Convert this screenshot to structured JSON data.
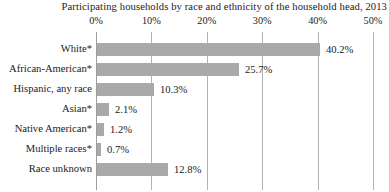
{
  "chart_data": {
    "type": "bar",
    "orientation": "horizontal",
    "title": "Participating households by race and ethnicity of the household head, 2013",
    "categories": [
      "White*",
      "African-American*",
      "Hispanic, any race",
      "Asian*",
      "Native American*",
      "Multiple races*",
      "Race unknown"
    ],
    "values": [
      40.2,
      25.7,
      10.3,
      2.1,
      1.2,
      0.7,
      12.8
    ],
    "value_labels": [
      "40.2%",
      "25.7%",
      "10.3%",
      "2.1%",
      "1.2%",
      "0.7%",
      "12.8%"
    ],
    "xlabel": "",
    "ylabel": "",
    "xlim": [
      0,
      50
    ],
    "x_tick_values": [
      0,
      10,
      20,
      30,
      40,
      50
    ],
    "x_tick_labels": [
      "0%",
      "10%",
      "20%",
      "30%",
      "40%",
      "50%"
    ],
    "grid": "vertical",
    "legend": "none",
    "bar_color": "#a9a9a9",
    "gridline_color": "#b2b2b2",
    "text_color": "#222222",
    "background_color": "#ffffff"
  }
}
